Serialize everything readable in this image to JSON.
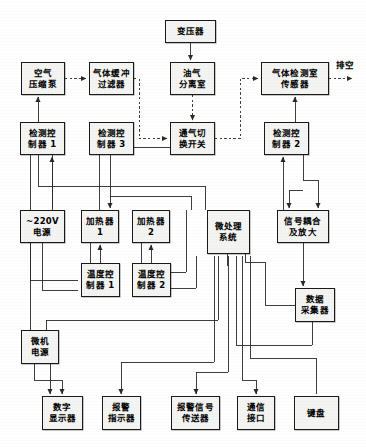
{
  "diagram": {
    "line_color": "#2a2a2a",
    "box_fill": "#f4f4f2",
    "box_border": "#1a1a1a",
    "nodes": [
      {
        "id": "transformer",
        "lines": [
          "变压器"
        ],
        "x": 165,
        "y": 20,
        "w": 51,
        "h": 23
      },
      {
        "id": "air-compressor",
        "lines": [
          "空气",
          "压缩泵"
        ],
        "x": 21,
        "y": 62,
        "w": 44,
        "h": 33
      },
      {
        "id": "gas-buffer-filter",
        "lines": [
          "气体缓冲",
          "过滤器"
        ],
        "x": 89,
        "y": 62,
        "w": 45,
        "h": 33
      },
      {
        "id": "oil-gas-separator",
        "lines": [
          "油气",
          "分离室"
        ],
        "x": 170,
        "y": 62,
        "w": 45,
        "h": 33
      },
      {
        "id": "gas-sensor",
        "lines": [
          "气体检测室",
          "传感器"
        ],
        "x": 261,
        "y": 62,
        "w": 68,
        "h": 33
      },
      {
        "id": "controller-1",
        "lines": [
          "检测控",
          "制器 1"
        ],
        "x": 20,
        "y": 122,
        "w": 45,
        "h": 33
      },
      {
        "id": "controller-3",
        "lines": [
          "检测控",
          "制器 3"
        ],
        "x": 89,
        "y": 122,
        "w": 45,
        "h": 33
      },
      {
        "id": "vent-switch",
        "lines": [
          "通气切",
          "换开关"
        ],
        "x": 170,
        "y": 122,
        "w": 45,
        "h": 33
      },
      {
        "id": "controller-2",
        "lines": [
          "检测控",
          "制器 2"
        ],
        "x": 264,
        "y": 122,
        "w": 45,
        "h": 33
      },
      {
        "id": "power-220v",
        "lines": [
          "~220V",
          "电源"
        ],
        "x": 20,
        "y": 210,
        "w": 45,
        "h": 33
      },
      {
        "id": "heater-1",
        "lines": [
          "加热器",
          "1"
        ],
        "x": 81,
        "y": 210,
        "w": 38,
        "h": 33
      },
      {
        "id": "heater-2",
        "lines": [
          "加热器",
          "2"
        ],
        "x": 132,
        "y": 210,
        "w": 38,
        "h": 33
      },
      {
        "id": "micro-system",
        "lines": [
          "微处理",
          "系统"
        ],
        "x": 207,
        "y": 210,
        "w": 43,
        "h": 44
      },
      {
        "id": "signal-amp",
        "lines": [
          "信号耦合",
          "及放大"
        ],
        "x": 277,
        "y": 210,
        "w": 52,
        "h": 33
      },
      {
        "id": "temp-controller-1",
        "lines": [
          "温度控",
          "制器 1"
        ],
        "x": 81,
        "y": 263,
        "w": 39,
        "h": 34
      },
      {
        "id": "temp-controller-2",
        "lines": [
          "温度控",
          "制器 2"
        ],
        "x": 132,
        "y": 263,
        "w": 39,
        "h": 34
      },
      {
        "id": "data-collector",
        "lines": [
          "数据",
          "采集器"
        ],
        "x": 295,
        "y": 288,
        "w": 40,
        "h": 34
      },
      {
        "id": "pc-power",
        "lines": [
          "微机",
          "电源"
        ],
        "x": 21,
        "y": 330,
        "w": 38,
        "h": 34
      },
      {
        "id": "digital-display",
        "lines": [
          "数字",
          "显示器"
        ],
        "x": 42,
        "y": 396,
        "w": 41,
        "h": 34
      },
      {
        "id": "alarm-indicator",
        "lines": [
          "报警",
          "指示器"
        ],
        "x": 102,
        "y": 396,
        "w": 39,
        "h": 34
      },
      {
        "id": "alarm-transmitter",
        "lines": [
          "报警信号",
          "传送器"
        ],
        "x": 171,
        "y": 396,
        "w": 49,
        "h": 34
      },
      {
        "id": "comm-interface",
        "lines": [
          "通信",
          "接口"
        ],
        "x": 237,
        "y": 396,
        "w": 38,
        "h": 34
      },
      {
        "id": "keyboard",
        "lines": [
          "键盘"
        ],
        "x": 294,
        "y": 396,
        "w": 45,
        "h": 34
      }
    ],
    "labels": [
      {
        "id": "vent-exhaust-label",
        "text": "排空",
        "x": 336,
        "y": 60
      }
    ]
  }
}
